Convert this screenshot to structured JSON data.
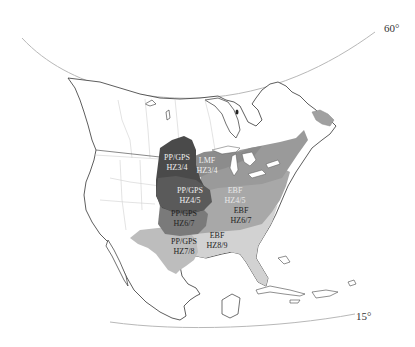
{
  "map": {
    "latitude_labels": {
      "north": "60°",
      "south": "15°"
    },
    "colors": {
      "background": "#ffffff",
      "land": "#ffffff",
      "coast": "#333333",
      "borders": "#d0d0d0",
      "graticule": "#b8b8b8",
      "pp_gps_hz3_4": "#4a4a4a",
      "pp_gps_hz4_5": "#5a5a5a",
      "lmf_hz3_4": "#8c8c8c",
      "pp_gps_hz6_7": "#7a7a7a",
      "ebf_hz4_5": "#9a9a9a",
      "ebf_hz6_7": "#a8a8a8",
      "pp_gps_hz7_8": "#bdbdbd",
      "ebf_hz8_9": "#d2d2d2",
      "lakes": "#ffffff",
      "label_dark": "#222222",
      "label_light": "#f0f0f0"
    },
    "zones": [
      {
        "id": "pp_gps_hz3_4",
        "line1": "PP/GPS",
        "line2": "HZ3/4"
      },
      {
        "id": "lmf_hz3_4",
        "line1": "LMF",
        "line2": "HZ3/4"
      },
      {
        "id": "pp_gps_hz4_5",
        "line1": "PP/GPS",
        "line2": "HZ4/5"
      },
      {
        "id": "ebf_hz4_5",
        "line1": "EBF",
        "line2": "HZ4/5"
      },
      {
        "id": "pp_gps_hz6_7",
        "line1": "PP/GPS",
        "line2": "HZ6/7"
      },
      {
        "id": "ebf_hz6_7",
        "line1": "EBF",
        "line2": "HZ6/7"
      },
      {
        "id": "pp_gps_hz7_8",
        "line1": "PP/GPS",
        "line2": "HZ7/8"
      },
      {
        "id": "ebf_hz8_9",
        "line1": "EBF",
        "line2": "HZ8/9"
      }
    ]
  }
}
